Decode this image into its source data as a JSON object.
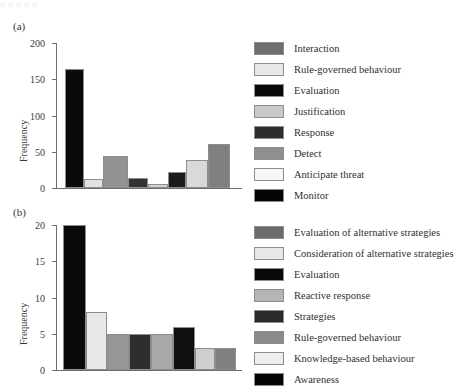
{
  "artifact": {
    "top_fragment": "ơ                                        ơ                       ơ                     ơ                   ơ"
  },
  "panels": [
    {
      "label": "(a)",
      "ylabel": "Frequency",
      "chart_index": 0
    },
    {
      "label": "(b)",
      "ylabel": "Frequency",
      "chart_index": 1
    }
  ],
  "chart_data": [
    {
      "type": "bar",
      "title": "(a)",
      "xlabel": "",
      "ylabel": "Frequency",
      "ylim": [
        0,
        200
      ],
      "yticks": [
        0,
        50,
        100,
        150,
        200
      ],
      "ytick_labels": [
        "0",
        "50",
        "100",
        "150",
        "200"
      ],
      "grid": false,
      "legend_position": "right",
      "categories": [
        "Interaction",
        "Rule-governed behaviour",
        "Evaluation",
        "Justification",
        "Response",
        "Detect",
        "Anticipate threat",
        "Monitor"
      ],
      "values": [
        164,
        13,
        44,
        14,
        5,
        22,
        38,
        61
      ],
      "bar_colors": [
        "#0a0a0a",
        "#e2e2e2",
        "#939393",
        "#333333",
        "#d2d2d2",
        "#1b1b1b",
        "#d9d9d9",
        "#808080"
      ],
      "legend": [
        {
          "label": "Interaction",
          "color": "#6e6e6e"
        },
        {
          "label": "Rule-governed behaviour",
          "color": "#e8e8e8"
        },
        {
          "label": "Evaluation",
          "color": "#0a0a0a"
        },
        {
          "label": "Justification",
          "color": "#c9c9c9"
        },
        {
          "label": "Response",
          "color": "#2e2e2e"
        },
        {
          "label": "Detect",
          "color": "#8f8f8f"
        },
        {
          "label": "Anticipate threat",
          "color": "#f7f7f7"
        },
        {
          "label": "Monitor",
          "color": "#050505"
        }
      ]
    },
    {
      "type": "bar",
      "title": "(b)",
      "xlabel": "",
      "ylabel": "Frequency",
      "ylim": [
        0,
        20
      ],
      "yticks": [
        0,
        5,
        10,
        15,
        20
      ],
      "ytick_labels": [
        "0",
        "5",
        "10",
        "15",
        "20"
      ],
      "grid": false,
      "legend_position": "right",
      "categories": [
        "Evaluation of alternative strategies",
        "Consideration of alternative strategies",
        "Evaluation",
        "Reactive response",
        "Strategies",
        "Rule-governed behaviour",
        "Knowledge-based behaviour",
        "Awareness"
      ],
      "values": [
        20,
        8,
        5,
        5,
        5,
        6,
        3,
        3
      ],
      "bar_colors": [
        "#0a0a0a",
        "#e8e8e8",
        "#969696",
        "#2e2e2e",
        "#a8a8a8",
        "#0f0f0f",
        "#cfcfcf",
        "#7f7f7f"
      ],
      "legend": [
        {
          "label": "Evaluation of alternative strategies",
          "color": "#6b6b6b"
        },
        {
          "label": "Consideration of alternative strategies",
          "color": "#e8e8e8"
        },
        {
          "label": "Evaluation",
          "color": "#0a0a0a"
        },
        {
          "label": "Reactive response",
          "color": "#b5b5b5"
        },
        {
          "label": "Strategies",
          "color": "#2b2b2b"
        },
        {
          "label": "Rule-governed behaviour",
          "color": "#8a8a8a"
        },
        {
          "label": "Knowledge-based behaviour",
          "color": "#eeeeee"
        },
        {
          "label": "Awareness",
          "color": "#050505"
        }
      ]
    }
  ]
}
